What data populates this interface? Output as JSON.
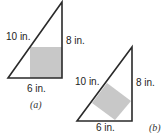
{
  "figures": [
    {
      "id": "a",
      "caption": "(a)",
      "hypotenuse_label": "10 in.",
      "vertical_leg_label": "8 in.",
      "base_label": "6 in.",
      "inscribed_square": "axis-aligned in right angle corner"
    },
    {
      "id": "b",
      "caption": "(b)",
      "hypotenuse_label": "10 in.",
      "vertical_leg_label": "8 in.",
      "base_label": "6 in.",
      "inscribed_square": "side lying on hypotenuse"
    }
  ],
  "colors": {
    "line": "#2a2a2a",
    "square_fill": "#c8c8c8"
  }
}
